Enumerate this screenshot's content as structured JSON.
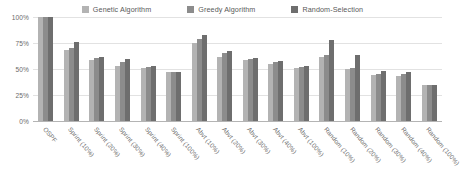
{
  "chart_data": {
    "type": "bar",
    "title": "",
    "subtitle": "",
    "xlabel": "",
    "ylabel": "",
    "ylim": [
      0,
      100
    ],
    "ytick_labels": [
      "100%",
      "75%",
      "50%",
      "25%",
      "0%"
    ],
    "ytick_values": [
      100,
      75,
      50,
      25,
      0
    ],
    "grid": true,
    "legend_position": "top-center",
    "categories": [
      "OSPF",
      "Sprint (10%)",
      "Sprint (20%)",
      "Sprint (30%)",
      "Sprint (40%)",
      "Sprint (100%)",
      "Abvt (10%)",
      "Abvt (20%)",
      "Abvt (30%)",
      "Abvt (40%)",
      "Abvt (100%)",
      "Random (10%)",
      "Random (20%)",
      "Random (30%)",
      "Random (40%)",
      "Random (100%)"
    ],
    "series": [
      {
        "name": "Genetic Algorithm",
        "color": "#b3b3b3",
        "values": [
          100,
          68,
          59,
          53,
          51,
          47,
          75,
          62,
          59,
          55,
          51,
          62,
          50,
          44,
          43,
          35
        ]
      },
      {
        "name": "Greedy Algorithm",
        "color": "#8c8c8c",
        "values": [
          100,
          70,
          61,
          57,
          52,
          47,
          79,
          65,
          60,
          57,
          52,
          63,
          51,
          45,
          45,
          35
        ]
      },
      {
        "name": "Random-Selection",
        "color": "#6e6e6e",
        "values": [
          100,
          76,
          62,
          60,
          53,
          47,
          83,
          67,
          61,
          58,
          53,
          78,
          63,
          48,
          47,
          35
        ]
      }
    ]
  },
  "legend": {
    "items": [
      {
        "label": "Genetic Algorithm",
        "color": "#b3b3b3"
      },
      {
        "label": "Greedy Algorithm",
        "color": "#8c8c8c"
      },
      {
        "label": "Random-Selection",
        "color": "#6e6e6e"
      }
    ]
  },
  "axes": {
    "y_ticks": [
      "100%",
      "75%",
      "50%",
      "25%",
      "0%"
    ]
  }
}
